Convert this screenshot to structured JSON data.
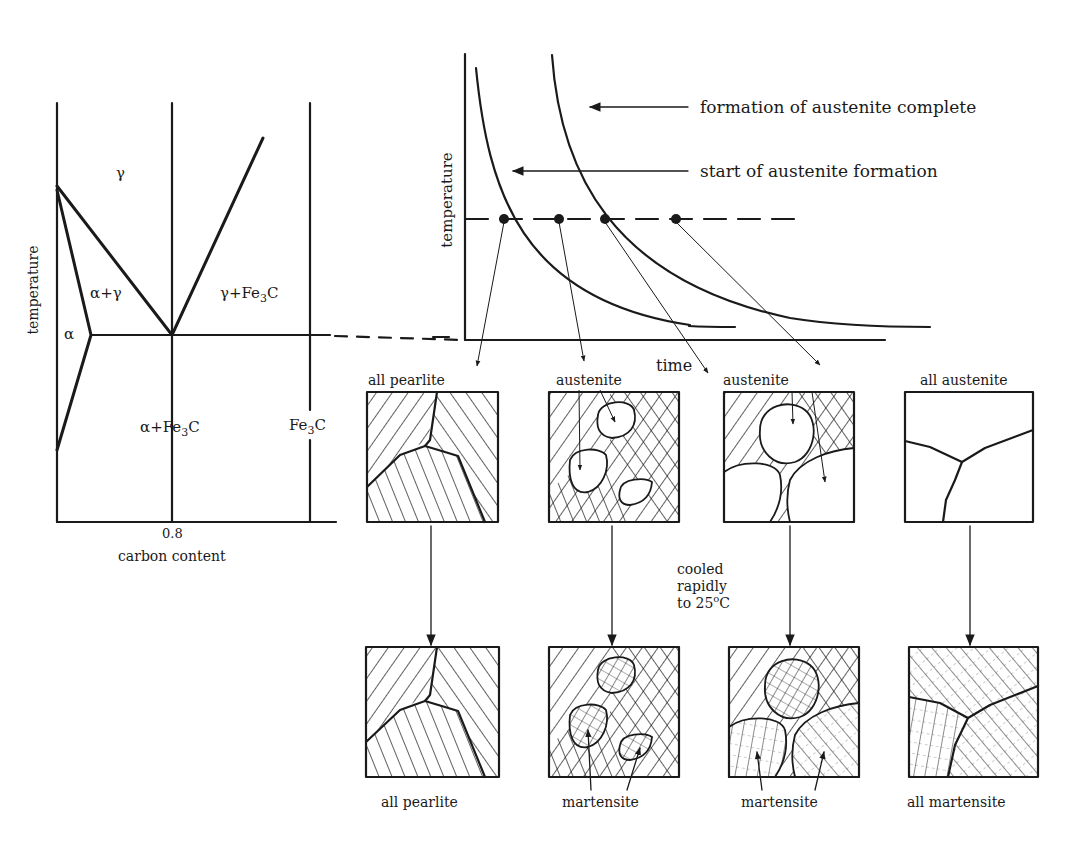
{
  "phase_diagram": {
    "ylabel": "temperature",
    "xlabel": "carbon content",
    "xtick": "0.8",
    "regions": {
      "gamma": "γ",
      "alpha_gamma": "α+γ",
      "gamma_fe3c": "γ+Fe3C",
      "alpha": "α",
      "alpha_fe3c": "α+Fe3C",
      "fe3c": "Fe3C"
    }
  },
  "transformation_diagram": {
    "ylabel": "temperature",
    "xlabel": "time",
    "curve_labels": {
      "complete": "formation of austenite complete",
      "start": "start of austenite formation"
    }
  },
  "heated_row": {
    "panels": [
      {
        "label": "all pearlite"
      },
      {
        "label": "austenite"
      },
      {
        "label": "austenite"
      },
      {
        "label": "all austenite"
      }
    ]
  },
  "cooling_note": {
    "line1": "cooled",
    "line2": "rapidly",
    "line3_prefix": "to 25",
    "line3_sup": "o",
    "line3_suffix": "C"
  },
  "cooled_row": {
    "panels": [
      {
        "label": "all pearlite"
      },
      {
        "label": "martensite"
      },
      {
        "label": "martensite"
      },
      {
        "label": "all martensite"
      }
    ]
  }
}
